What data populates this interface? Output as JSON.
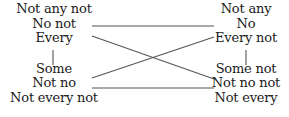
{
  "diagram": {
    "type": "square-of-opposition",
    "left_column": {
      "top_group": [
        "Not any not",
        "No not",
        "Every"
      ],
      "bottom_group": [
        "Some",
        "Not no",
        "Not every not"
      ]
    },
    "right_column": {
      "top_group": [
        "Not any",
        "No",
        "Every not"
      ],
      "bottom_group": [
        "Some not",
        "Not no not",
        "Not every"
      ]
    },
    "connections": [
      {
        "from": "left.top",
        "to": "right.top",
        "style": "horizontal"
      },
      {
        "from": "left.bottom",
        "to": "right.bottom",
        "style": "horizontal"
      },
      {
        "from": "left.top",
        "to": "right.bottom",
        "style": "diagonal"
      },
      {
        "from": "left.bottom",
        "to": "right.top",
        "style": "diagonal"
      },
      {
        "from": "left.top",
        "to": "left.bottom",
        "style": "vertical"
      },
      {
        "from": "right.top",
        "to": "right.bottom",
        "style": "vertical"
      }
    ],
    "line_color": "#555555",
    "text_color": "#1a1a1a"
  }
}
